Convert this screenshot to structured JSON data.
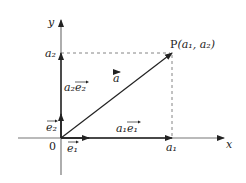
{
  "diagram": {
    "axes": {
      "x_label": "x",
      "y_label": "y",
      "origin_label": "0"
    },
    "point": {
      "name": "P",
      "coords_text": "(a₁,  a₂)",
      "x_label": "a₁",
      "y_label": "a₂"
    },
    "vectors": {
      "a": "a",
      "e1": "e₁",
      "e2": "e₂",
      "a1e1": "a₁e₁",
      "a2e2": "a₂e₂"
    },
    "colors": {
      "line": "#222222",
      "axis": "#555555",
      "dashed": "#666666"
    }
  }
}
